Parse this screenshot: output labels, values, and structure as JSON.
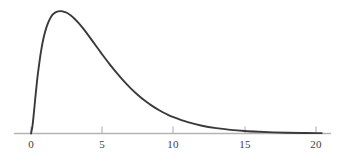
{
  "chart_data": {
    "type": "line",
    "title": "",
    "subtitle": "",
    "xlabel": "",
    "ylabel": "",
    "xlim": [
      0,
      20.6
    ],
    "ylim": [
      0,
      0.175
    ],
    "grid": false,
    "legend": null,
    "legend_position": "none",
    "axis": {
      "x_axis_visible": true,
      "y_axis_visible": false,
      "tick_direction": "up",
      "tick_labels": [
        "0",
        "5",
        "10",
        "15",
        "20"
      ],
      "tick_values": [
        0,
        5,
        10,
        15,
        20
      ],
      "axis_color": "#b4b4b4",
      "tick_color": "#b0b0b0",
      "label_color": "#3d3d3d"
    },
    "series": [
      {
        "name": "density",
        "color": "#3a3a3a",
        "line_width": 1.9,
        "x": [
          0,
          0.1,
          0.2,
          0.3,
          0.4,
          0.5,
          0.7,
          0.9,
          1.1,
          1.3,
          1.5,
          1.7,
          1.9,
          2.1,
          2.2,
          2.4,
          2.6,
          2.8,
          3.0,
          3.3,
          3.6,
          4.0,
          4.4,
          4.8,
          5.0,
          5.5,
          6.0,
          6.5,
          7.0,
          7.5,
          8.0,
          8.5,
          9.0,
          9.5,
          10.0,
          11.0,
          12.0,
          13.0,
          14.0,
          15.0,
          16.0,
          17.0,
          18.0,
          19.0,
          20.0,
          20.4
        ],
        "y": [
          0.0,
          0.009,
          0.026,
          0.045,
          0.063,
          0.079,
          0.105,
          0.124,
          0.137,
          0.146,
          0.152,
          0.155,
          0.1565,
          0.1568,
          0.1566,
          0.1556,
          0.1538,
          0.1512,
          0.1481,
          0.1424,
          0.1359,
          0.1264,
          0.1164,
          0.1063,
          0.1013,
          0.0893,
          0.0779,
          0.0674,
          0.0579,
          0.0494,
          0.0419,
          0.0354,
          0.0298,
          0.025,
          0.0209,
          0.0145,
          0.01,
          0.0069,
          0.0047,
          0.0032,
          0.0022,
          0.0015,
          0.001,
          0.0007,
          0.0005,
          0.00042
        ]
      }
    ],
    "peak": {
      "x": 2.1,
      "y": 0.157
    },
    "notes": "Right-skewed unimodal probability density curve rising from the origin, peaking near x = 2.1 and decaying with a long tail toward x = 20."
  },
  "ticks": [
    {
      "label": "0",
      "value": 0,
      "px": 31
    },
    {
      "label": "5",
      "value": 5,
      "px": 102
    },
    {
      "label": "10",
      "value": 10,
      "px": 173
    },
    {
      "label": "15",
      "value": 15,
      "px": 245
    },
    {
      "label": "20",
      "value": 20,
      "px": 316
    }
  ]
}
